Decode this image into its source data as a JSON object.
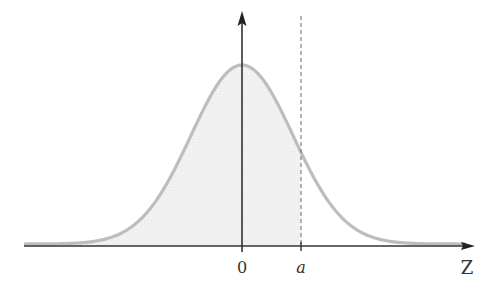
{
  "diagram": {
    "x_axis_label": "Z",
    "origin_label": "0",
    "marker_label": "a",
    "colors": {
      "curve": "#bdbdbd",
      "shade": "#efefef",
      "axis": "#333333",
      "dashed": "#777777"
    }
  },
  "chart_data": {
    "type": "area",
    "title": "",
    "xlabel": "Z",
    "ylabel": "",
    "distribution": "standard normal",
    "mean": 0,
    "shaded_region": "Z <= a",
    "marker": {
      "label": "a",
      "z_approx": 1.15
    },
    "x_ticks": [
      "0",
      "a"
    ],
    "xlim": [
      -4.3,
      4.3
    ]
  }
}
